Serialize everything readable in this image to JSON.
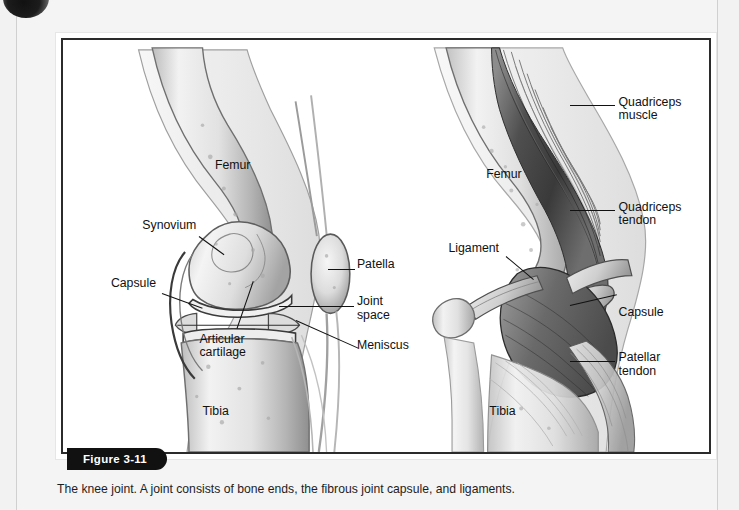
{
  "figure": {
    "tab_label": "Figure 3-11",
    "caption": "The knee joint. A joint consists of bone ends, the fibrous joint capsule, and ligaments."
  },
  "colors": {
    "page_background": "#f2f2f2",
    "sheet_background": "#f4f4f4",
    "figure_border": "#2b2b2b",
    "tab_background": "#111111",
    "tab_text": "#ffffff",
    "label_text": "#111111",
    "bone_light": "#e9e9e9",
    "bone_mid": "#c9c9c9",
    "bone_shadow": "#8d8d8d",
    "muscle_dark": "#4a4a4a",
    "outline": "#2a2a2a"
  },
  "panels": {
    "left": {
      "name": "sagittal-knee-joint-capsule",
      "labels": [
        {
          "id": "femur",
          "text": "Femur"
        },
        {
          "id": "synovium",
          "text": "Synovium"
        },
        {
          "id": "capsule",
          "text": "Capsule"
        },
        {
          "id": "articular-cartilage",
          "text": "Articular\ncartilage"
        },
        {
          "id": "tibia",
          "text": "Tibia"
        },
        {
          "id": "patella",
          "text": "Patella"
        },
        {
          "id": "joint-space",
          "text": "Joint\nspace"
        },
        {
          "id": "meniscus",
          "text": "Meniscus"
        }
      ]
    },
    "right": {
      "name": "sagittal-knee-muscles-tendons",
      "labels": [
        {
          "id": "quadriceps-muscle",
          "text": "Quadriceps\nmuscle"
        },
        {
          "id": "quadriceps-tendon",
          "text": "Quadriceps\ntendon"
        },
        {
          "id": "capsule",
          "text": "Capsule"
        },
        {
          "id": "patellar-tendon",
          "text": "Patellar\ntendon"
        },
        {
          "id": "femur",
          "text": "Femur"
        },
        {
          "id": "ligament",
          "text": "Ligament"
        },
        {
          "id": "tibia",
          "text": "Tibia"
        }
      ]
    }
  }
}
